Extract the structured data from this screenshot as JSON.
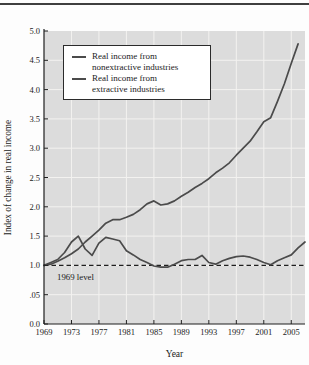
{
  "figure": {
    "bg": "#fdfdfd",
    "top_rule_color": "#3f3f3f"
  },
  "chart_data": {
    "type": "line",
    "title": "",
    "xlabel": "Year",
    "ylabel": "Index of change in real income",
    "xlim": [
      1969,
      2007
    ],
    "ylim": [
      0,
      5.0
    ],
    "grid": true,
    "plot_bg": "#dcdcdc",
    "grid_color": "#f3f2f0",
    "axis_color": "#1f1f1f",
    "text_color": "#1b1b1b",
    "line_color": "#4b4b4b",
    "x_ticks": [
      1969,
      1973,
      1977,
      1981,
      1985,
      1989,
      1993,
      1997,
      2001,
      2005
    ],
    "y_tick_values": [
      5.0,
      4.5,
      4.0,
      3.5,
      3.0,
      2.5,
      2.0,
      1.5,
      1.0,
      0.5,
      0.0
    ],
    "y_tick_labels": [
      "5.0",
      "4.5",
      "4.0",
      "3.5",
      "3.0",
      "2.5",
      "2.0",
      "1.5",
      "1.0",
      ".05",
      "0.0"
    ],
    "reference_line": {
      "value": 1.0,
      "style": "dashed",
      "color": "#1f1f1f",
      "label": "1969 level"
    },
    "legend": {
      "position": "top-left",
      "entries": [
        {
          "label_lines": [
            "Real income from",
            "nonextractive industries"
          ]
        },
        {
          "label_lines": [
            "Real income from",
            "extractive industries"
          ]
        }
      ]
    },
    "series": [
      {
        "name": "Real income from nonextractive industries",
        "slug": "nonextractive",
        "start_year": 1969,
        "values": [
          1.0,
          1.02,
          1.07,
          1.13,
          1.2,
          1.28,
          1.4,
          1.5,
          1.6,
          1.72,
          1.78,
          1.78,
          1.82,
          1.87,
          1.95,
          2.05,
          2.1,
          2.03,
          2.05,
          2.1,
          2.18,
          2.25,
          2.33,
          2.4,
          2.48,
          2.58,
          2.66,
          2.75,
          2.88,
          3.0,
          3.12,
          3.28,
          3.45,
          3.52,
          3.8,
          4.1,
          4.45,
          4.78
        ]
      },
      {
        "name": "Real income from extractive industries",
        "slug": "extractive",
        "start_year": 1969,
        "values": [
          1.0,
          1.05,
          1.1,
          1.22,
          1.4,
          1.5,
          1.28,
          1.17,
          1.38,
          1.48,
          1.45,
          1.42,
          1.25,
          1.18,
          1.1,
          1.05,
          0.99,
          0.97,
          0.97,
          1.02,
          1.08,
          1.1,
          1.1,
          1.17,
          1.05,
          1.02,
          1.08,
          1.12,
          1.15,
          1.16,
          1.14,
          1.1,
          1.05,
          1.01,
          1.08,
          1.13,
          1.18,
          1.3,
          1.4
        ]
      }
    ]
  }
}
